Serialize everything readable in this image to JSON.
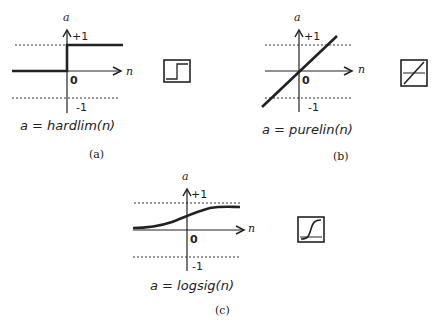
{
  "figure": {
    "panels": [
      {
        "id": "a",
        "caption": "(a)",
        "equation": "a = hardlim(n)",
        "y_axis_label": "a",
        "x_axis_label": "n",
        "tick_plus": "+1",
        "tick_minus": "-1",
        "origin_label": "0",
        "icon": "step-function-icon"
      },
      {
        "id": "b",
        "caption": "(b)",
        "equation": "a = purelin(n)",
        "y_axis_label": "a",
        "x_axis_label": "n",
        "tick_plus": "+1",
        "tick_minus": "-1",
        "origin_label": "0",
        "icon": "linear-function-icon"
      },
      {
        "id": "c",
        "caption": "(c)",
        "equation": "a = logsig(n)",
        "y_axis_label": "a",
        "x_axis_label": "n",
        "tick_plus": "+1",
        "tick_minus": "-1",
        "origin_label": "0",
        "icon": "sigmoid-function-icon"
      }
    ]
  },
  "colors": {
    "ink": "#222222",
    "background": "#ffffff"
  }
}
